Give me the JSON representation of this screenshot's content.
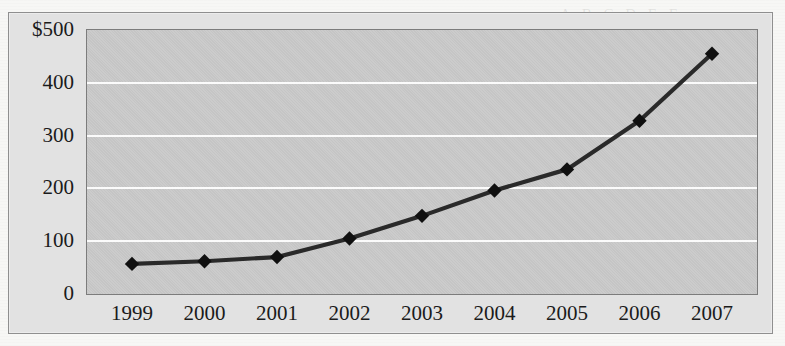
{
  "chart_data": {
    "type": "line",
    "title": "",
    "subtitle": "",
    "xlabel": "",
    "ylabel": "",
    "categories": [
      "1999",
      "2000",
      "2001",
      "2002",
      "2003",
      "2004",
      "2005",
      "2006",
      "2007"
    ],
    "values": [
      57,
      62,
      70,
      105,
      148,
      196,
      236,
      328,
      455
    ],
    "series": [
      {
        "name": "",
        "values": [
          57,
          62,
          70,
          105,
          148,
          196,
          236,
          328,
          455
        ]
      }
    ],
    "ylim": [
      0,
      500
    ],
    "yticks": [
      0,
      100,
      200,
      300,
      400,
      500
    ],
    "ytick_labels": [
      "0",
      "100",
      "200",
      "300",
      "400",
      "$500"
    ],
    "currency_symbol": "$",
    "grid": true,
    "gridlines_at": [
      100,
      200,
      300,
      400
    ],
    "legend": false,
    "legend_position": "none",
    "marker": "diamond",
    "line_color": "#2a2a2a",
    "marker_color": "#101010",
    "plot_background": "#c9c9c9",
    "gridline_color": "#fbfbfb",
    "frame_background": "#e2e2e2",
    "annotations": []
  },
  "page": {
    "bleed_text_1": "the most recent years in a row",
    "bleed_text_2": "been for the last decade",
    "bleed_text_3": "A B C D E F"
  }
}
